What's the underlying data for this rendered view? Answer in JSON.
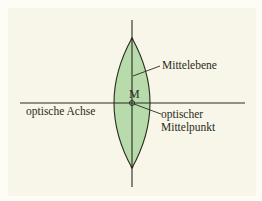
{
  "diagram": {
    "title": "",
    "type": "biconvex-lens",
    "colors": {
      "background": "#f8f6e8",
      "lens_fill": "#b7dbab",
      "line": "#2a2a22"
    },
    "labels": {
      "mittelebene": "Mittelebene",
      "center": "M",
      "optical_axis": "optische Achse",
      "optical_center_line1": "optischer",
      "optical_center_line2": "Mittelpunkt"
    },
    "nodes": [
      {
        "id": "lens",
        "label": "",
        "shape": "biconvex"
      },
      {
        "id": "M",
        "label": "M",
        "shape": "point"
      }
    ],
    "edges": [
      {
        "from": "mittelebene-label",
        "to": "lens-vertical-line",
        "label": "Mittelebene"
      },
      {
        "from": "optical-center-label",
        "to": "M",
        "label": "optischer Mittelpunkt"
      }
    ]
  }
}
